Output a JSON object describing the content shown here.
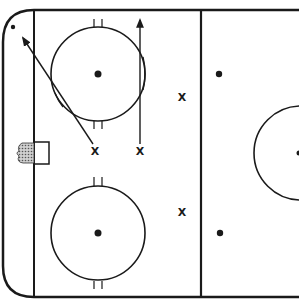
{
  "diagram": {
    "title": "",
    "type": "hockey-rink-drill",
    "colors": {
      "line": "#1a1a1a",
      "background": "#ffffff",
      "net": "#888888"
    },
    "players": [
      {
        "id": "p1",
        "label": "X",
        "x": 95,
        "y": 151
      },
      {
        "id": "p2",
        "label": "X",
        "x": 140,
        "y": 151
      },
      {
        "id": "p3",
        "label": "X",
        "x": 182,
        "y": 99
      },
      {
        "id": "p4",
        "label": "X",
        "x": 182,
        "y": 214
      }
    ],
    "arrows": [
      {
        "id": "a1",
        "from": "p1",
        "direction": "diagonal-up-left"
      },
      {
        "id": "a2",
        "from": "p2",
        "direction": "straight-up"
      }
    ]
  }
}
